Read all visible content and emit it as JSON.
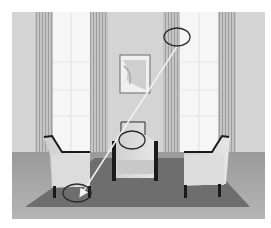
{
  "image": {
    "description": "Rendered living room interior with three armchairs on a dark rug, tall curtained windows, and a framed picture; annotated with three ellipses connected by an arrow",
    "colors": {
      "background": "#ffffff",
      "wall": "#d4d4d4",
      "window": "#f6f6f6",
      "curtain": "#bdbdbd",
      "floor": "#a8a8a8",
      "rug": "#6e6e6e",
      "chair": "#d8d8d8",
      "chair_frame": "#1a1a1a",
      "annotation": "#2a2a2a",
      "arrow": "#f2f2f2"
    },
    "annotations": [
      {
        "shape": "ellipse",
        "label": "top-ellipse-on-curtain",
        "cx": 177,
        "cy": 37,
        "rx": 13,
        "ry": 9
      },
      {
        "shape": "ellipse",
        "label": "middle-ellipse-on-center-chair-back",
        "cx": 132,
        "cy": 140,
        "rx": 13,
        "ry": 9
      },
      {
        "shape": "ellipse",
        "label": "bottom-ellipse-on-rug",
        "cx": 77,
        "cy": 193,
        "rx": 14,
        "ry": 9
      }
    ],
    "arrow": {
      "from": [
        178,
        45
      ],
      "to": [
        80,
        196
      ]
    }
  }
}
